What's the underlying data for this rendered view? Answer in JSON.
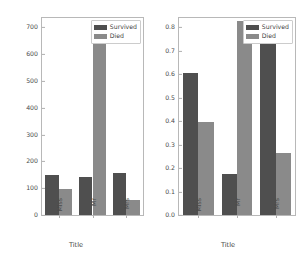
{
  "figure": {
    "background": "#ffffff",
    "colors": {
      "survived": "#4f4f4f",
      "died": "#8a8a8a",
      "axis": "#b8b8b8",
      "text": "#4a4a4a"
    }
  },
  "legend": {
    "survived_label": "Survived",
    "died_label": "Died"
  },
  "chart_data": [
    {
      "type": "bar",
      "id": "counts",
      "title": "",
      "xlabel": "Title",
      "ylabel": "",
      "categories": [
        "Miss",
        "Mr",
        "Mrs"
      ],
      "series": [
        {
          "name": "Survived",
          "color": "#4f4f4f",
          "values": [
            150,
            141,
            157
          ]
        },
        {
          "name": "Died",
          "color": "#8a8a8a",
          "values": [
            98,
            672,
            56
          ]
        }
      ],
      "ylim": [
        0,
        735
      ],
      "yticks": [
        0,
        100,
        200,
        300,
        400,
        500,
        600,
        700
      ],
      "ytick_labels": [
        "0",
        "100",
        "200",
        "300",
        "400",
        "500",
        "600",
        "700"
      ],
      "grid": false,
      "legend_position": "upper right"
    },
    {
      "type": "bar",
      "id": "proportions",
      "title": "",
      "xlabel": "Title",
      "ylabel": "",
      "categories": [
        "Miss",
        "Mr",
        "Mrs"
      ],
      "series": [
        {
          "name": "Survived",
          "color": "#4f4f4f",
          "values": [
            0.605,
            0.173,
            0.737
          ]
        },
        {
          "name": "Died",
          "color": "#8a8a8a",
          "values": [
            0.395,
            0.827,
            0.263
          ]
        }
      ],
      "ylim": [
        0,
        0.84
      ],
      "yticks": [
        0.0,
        0.1,
        0.2,
        0.3,
        0.4,
        0.5,
        0.6,
        0.7,
        0.8
      ],
      "ytick_labels": [
        "0.0",
        "0.1",
        "0.2",
        "0.3",
        "0.4",
        "0.5",
        "0.6",
        "0.7",
        "0.8"
      ],
      "grid": false,
      "legend_position": "upper right"
    }
  ]
}
